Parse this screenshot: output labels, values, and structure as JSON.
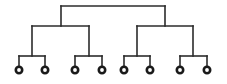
{
  "diagram": {
    "type": "binary-tree-dendrogram",
    "colors": {
      "line": "#2b2b2b",
      "leaf_fill": "#ffffff",
      "leaf_stroke": "#1a1a1a",
      "background": "#ffffff"
    },
    "levels": 3,
    "root": {
      "x": 113,
      "bar_y": 6,
      "left_x": 61,
      "right_x": 165
    },
    "internal_nodes": [
      {
        "id": "L",
        "x": 61,
        "bar_y": 26,
        "left_x": 32,
        "right_x": 89,
        "top_y": 6
      },
      {
        "id": "R",
        "x": 165,
        "bar_y": 26,
        "left_x": 137,
        "right_x": 193,
        "top_y": 6
      },
      {
        "id": "LL",
        "x": 32,
        "bar_y": 56,
        "left_x": 19,
        "right_x": 45,
        "top_y": 26
      },
      {
        "id": "LR",
        "x": 89,
        "bar_y": 56,
        "left_x": 75,
        "right_x": 102,
        "top_y": 26
      },
      {
        "id": "RL",
        "x": 137,
        "bar_y": 56,
        "left_x": 124,
        "right_x": 150,
        "top_y": 26
      },
      {
        "id": "RR",
        "x": 193,
        "bar_y": 56,
        "left_x": 180,
        "right_x": 207,
        "top_y": 26
      }
    ],
    "leaves": [
      {
        "x": 19,
        "y": 70
      },
      {
        "x": 45,
        "y": 70
      },
      {
        "x": 75,
        "y": 70
      },
      {
        "x": 102,
        "y": 70
      },
      {
        "x": 124,
        "y": 70
      },
      {
        "x": 150,
        "y": 70
      },
      {
        "x": 180,
        "y": 70
      },
      {
        "x": 207,
        "y": 70
      }
    ]
  }
}
